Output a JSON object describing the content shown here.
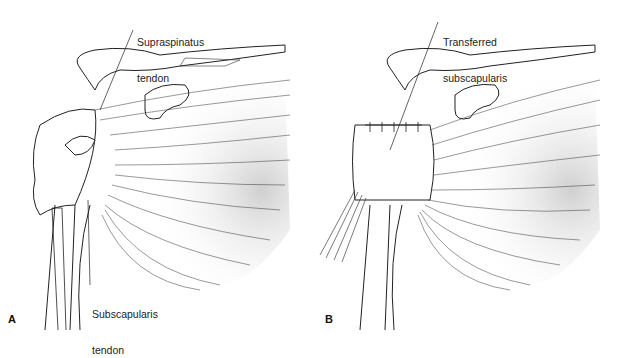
{
  "figure": {
    "panels": [
      {
        "id": "A",
        "letter": "A",
        "labels": [
          {
            "line1": "Supraspinatus",
            "line2": "tendon"
          },
          {
            "line1": "Subscapularis",
            "line2": "tendon"
          }
        ]
      },
      {
        "id": "B",
        "letter": "B",
        "labels": [
          {
            "line1": "Transferred",
            "line2": "subscapularis"
          }
        ]
      }
    ],
    "colors": {
      "line": "#222222",
      "shade": "#d8d8d8",
      "background": "#ffffff"
    }
  }
}
